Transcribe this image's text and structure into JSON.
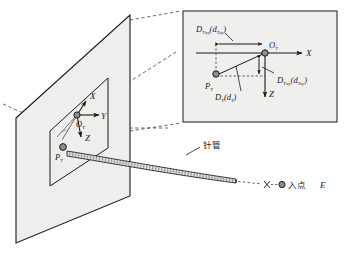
{
  "figure": {
    "title": ""
  },
  "colors": {
    "line": "#1a1a1a",
    "plane_fill": "#eeeeec",
    "inset_fill": "#efefed",
    "marker_fill": "#8d8d8d",
    "marker_stroke": "#1a1a1a",
    "needle_fill": "#e8e8e6",
    "dashed": "#2a2a2a"
  },
  "main_scene": {
    "origin_label": "O",
    "origin_sub": "T",
    "point_label": "P",
    "point_sub": "T",
    "axes": [
      {
        "name": "axis-x",
        "label": "X"
      },
      {
        "name": "axis-y",
        "label": "Y"
      },
      {
        "name": "axis-z",
        "label": "Z"
      }
    ],
    "needle_label": "针管",
    "entry_label": "入点",
    "entry_symbol": "E"
  },
  "inset": {
    "origin_label": "O",
    "origin_sub": "T",
    "point_label": "P",
    "point_sub": "T",
    "axis_x": "X",
    "axis_z": "Z",
    "measures": [
      {
        "name": "d-txy-horizontal",
        "main": "D",
        "main_sub": "Txy",
        "paren_open": "(",
        "arg": "d",
        "arg_sub": "Txy",
        "paren_close": ")"
      },
      {
        "name": "d-txy-vertical",
        "main": "D",
        "main_sub": "Txy",
        "paren_open": "(",
        "arg": "d",
        "arg_sub": "Txy",
        "paren_close": ")"
      },
      {
        "name": "d-t-diagonal",
        "main": "D",
        "main_sub": "T",
        "paren_open": "(",
        "arg": "d",
        "arg_sub": "T",
        "paren_close": ")"
      }
    ]
  }
}
